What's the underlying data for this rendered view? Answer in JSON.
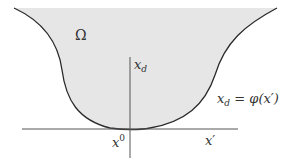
{
  "diagram": {
    "type": "domain-boundary-graph",
    "region_label": "Ω",
    "vertical_axis_label": {
      "base": "x",
      "sub": "d"
    },
    "horizontal_axis_label": {
      "base": "x",
      "prime": "′"
    },
    "origin_label": {
      "base": "x",
      "sup": "0"
    },
    "boundary_equation": {
      "lhs_base": "x",
      "lhs_sub": "d",
      "eq": " = ",
      "rhs_func": "φ",
      "rhs_arg": "(x′)"
    },
    "colors": {
      "fill": "#e6e6e6",
      "curve": "#2a2a2a",
      "axes": "#555555",
      "text": "#333333"
    }
  }
}
